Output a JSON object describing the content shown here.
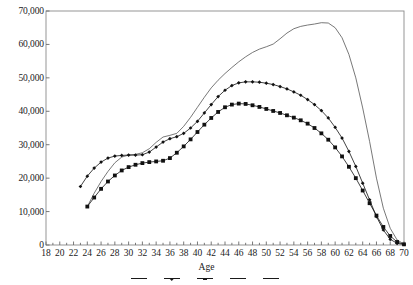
{
  "chart_data": {
    "type": "line",
    "title": "",
    "xlabel": "Age",
    "ylabel": "",
    "xlim": [
      18,
      70
    ],
    "ylim": [
      0,
      70000
    ],
    "grid": false,
    "legend_position": "bottom",
    "x_ticks": [
      18,
      20,
      22,
      24,
      26,
      28,
      30,
      32,
      34,
      36,
      38,
      40,
      42,
      44,
      46,
      48,
      50,
      52,
      54,
      56,
      58,
      60,
      62,
      64,
      66,
      68,
      70
    ],
    "x_tick_labels": [
      "18",
      "20",
      "22",
      "24",
      "26",
      "28",
      "30",
      "32",
      "34",
      "36",
      "38",
      "40",
      "42",
      "44",
      "46",
      "48",
      "50",
      "52",
      "54",
      "56",
      "58",
      "60",
      "62",
      "64",
      "66",
      "68",
      "70"
    ],
    "y_ticks": [
      0,
      10000,
      20000,
      30000,
      40000,
      50000,
      60000,
      70000
    ],
    "y_tick_labels": [
      "0",
      "10,000",
      "20,000",
      "30,000",
      "40,000",
      "50,000",
      "60,000",
      "70,000"
    ],
    "series": [
      {
        "name": "plain-line",
        "marker": "none",
        "color": "#555555",
        "x": [
          24,
          25,
          26,
          27,
          28,
          29,
          30,
          31,
          32,
          33,
          34,
          35,
          36,
          37,
          38,
          39,
          40,
          41,
          42,
          43,
          44,
          45,
          46,
          47,
          48,
          49,
          50,
          51,
          52,
          53,
          54,
          55,
          56,
          57,
          58,
          59,
          60,
          61,
          62,
          63,
          64,
          65,
          66,
          67,
          68,
          69,
          70
        ],
        "values": [
          11500,
          15500,
          19000,
          22000,
          24600,
          26300,
          26900,
          27100,
          27600,
          28800,
          30700,
          32300,
          32800,
          33400,
          35500,
          38200,
          41200,
          44200,
          47000,
          49300,
          51300,
          53100,
          54800,
          56300,
          57600,
          58600,
          59300,
          60100,
          61700,
          63400,
          64700,
          65400,
          65800,
          66100,
          66500,
          66400,
          65000,
          62000,
          57000,
          50000,
          41000,
          31000,
          20000,
          11000,
          5000,
          1500,
          300
        ]
      },
      {
        "name": "diamond-marker-line",
        "marker": "diamond",
        "color": "#111111",
        "x": [
          23,
          24,
          25,
          26,
          27,
          28,
          29,
          30,
          31,
          32,
          33,
          34,
          35,
          36,
          37,
          38,
          39,
          40,
          41,
          42,
          43,
          44,
          45,
          46,
          47,
          48,
          49,
          50,
          51,
          52,
          53,
          54,
          55,
          56,
          57,
          58,
          59,
          60,
          61,
          62,
          63,
          64,
          65,
          66,
          67,
          68,
          69,
          70
        ],
        "values": [
          17500,
          20600,
          23000,
          24800,
          26000,
          26600,
          26800,
          26900,
          26900,
          27000,
          27800,
          29300,
          30800,
          31800,
          32400,
          33400,
          35000,
          37000,
          39500,
          42000,
          44400,
          46300,
          47700,
          48500,
          48800,
          48800,
          48700,
          48400,
          48000,
          47400,
          46700,
          45800,
          44800,
          43500,
          42000,
          40200,
          38000,
          35200,
          32000,
          28000,
          23500,
          18500,
          13500,
          8500,
          4500,
          1700,
          500,
          150
        ]
      },
      {
        "name": "square-marker-line",
        "marker": "square",
        "color": "#111111",
        "x": [
          24,
          25,
          26,
          27,
          28,
          29,
          30,
          31,
          32,
          33,
          34,
          35,
          36,
          37,
          38,
          39,
          40,
          41,
          42,
          43,
          44,
          45,
          46,
          47,
          48,
          49,
          50,
          51,
          52,
          53,
          54,
          55,
          56,
          57,
          58,
          59,
          60,
          61,
          62,
          63,
          64,
          65,
          66,
          67,
          68,
          69,
          70
        ],
        "values": [
          11500,
          14200,
          16800,
          19000,
          20800,
          22300,
          23300,
          24000,
          24500,
          24800,
          25000,
          25200,
          26000,
          27600,
          29500,
          31600,
          33800,
          36000,
          38000,
          39800,
          41200,
          42000,
          42300,
          42200,
          41800,
          41300,
          40700,
          40100,
          39500,
          38800,
          38100,
          37300,
          36300,
          35000,
          33400,
          31500,
          29200,
          26500,
          23400,
          20000,
          16300,
          12500,
          8800,
          5400,
          2700,
          900,
          200
        ]
      }
    ]
  },
  "axis": {
    "x_title": "Age"
  },
  "legend": {
    "note": "legend row truncated at image bottom edge",
    "entries": [
      {
        "label": "",
        "marker": "none"
      },
      {
        "label": "",
        "marker": "diamond"
      },
      {
        "label": "",
        "marker": "square"
      },
      {
        "label": "",
        "marker": "none"
      },
      {
        "label": "",
        "marker": "none"
      }
    ]
  }
}
